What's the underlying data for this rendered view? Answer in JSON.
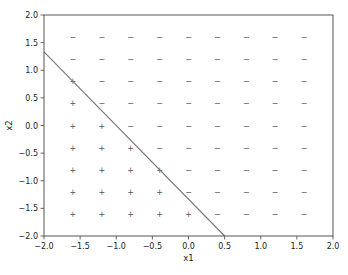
{
  "chart_data": {
    "type": "scatter",
    "title": "",
    "xlabel": "x1",
    "ylabel": "x2",
    "xlim": [
      -2.0,
      2.0
    ],
    "ylim": [
      -2.0,
      2.0
    ],
    "xticks": [
      -2.0,
      -1.5,
      -1.0,
      -0.5,
      0.0,
      0.5,
      1.0,
      1.5,
      2.0
    ],
    "yticks": [
      -2.0,
      -1.5,
      -1.0,
      -0.5,
      0.0,
      0.5,
      1.0,
      1.5,
      2.0
    ],
    "xtick_labels": [
      "−2.0",
      "−1.5",
      "−1.0",
      "−0.5",
      "0.0",
      "0.5",
      "1.0",
      "1.5",
      "2.0"
    ],
    "ytick_labels": [
      "−2.0",
      "−1.5",
      "−1.0",
      "−0.5",
      "0.0",
      "0.5",
      "1.0",
      "1.5",
      "2.0"
    ],
    "grid": false,
    "legend": null,
    "grid_x": [
      -1.6,
      -1.2,
      -0.8,
      -0.4,
      0.0,
      0.4,
      0.8,
      1.2,
      1.6
    ],
    "grid_y": [
      -1.6,
      -1.2,
      -0.8,
      -0.4,
      0.0,
      0.4,
      0.8,
      1.2,
      1.6
    ],
    "points": [
      {
        "x": -1.6,
        "y": 1.6,
        "label": "−"
      },
      {
        "x": -1.2,
        "y": 1.6,
        "label": "−"
      },
      {
        "x": -0.8,
        "y": 1.6,
        "label": "−"
      },
      {
        "x": -0.4,
        "y": 1.6,
        "label": "−"
      },
      {
        "x": 0.0,
        "y": 1.6,
        "label": "−"
      },
      {
        "x": 0.4,
        "y": 1.6,
        "label": "−"
      },
      {
        "x": 0.8,
        "y": 1.6,
        "label": "−"
      },
      {
        "x": 1.2,
        "y": 1.6,
        "label": "−"
      },
      {
        "x": 1.6,
        "y": 1.6,
        "label": "−"
      },
      {
        "x": -1.6,
        "y": 1.2,
        "label": "−"
      },
      {
        "x": -1.2,
        "y": 1.2,
        "label": "−"
      },
      {
        "x": -0.8,
        "y": 1.2,
        "label": "−"
      },
      {
        "x": -0.4,
        "y": 1.2,
        "label": "−"
      },
      {
        "x": 0.0,
        "y": 1.2,
        "label": "−"
      },
      {
        "x": 0.4,
        "y": 1.2,
        "label": "−"
      },
      {
        "x": 0.8,
        "y": 1.2,
        "label": "−"
      },
      {
        "x": 1.2,
        "y": 1.2,
        "label": "−"
      },
      {
        "x": 1.6,
        "y": 1.2,
        "label": "−"
      },
      {
        "x": -1.6,
        "y": 0.8,
        "label": "+"
      },
      {
        "x": -1.2,
        "y": 0.8,
        "label": "−"
      },
      {
        "x": -0.8,
        "y": 0.8,
        "label": "−"
      },
      {
        "x": -0.4,
        "y": 0.8,
        "label": "−"
      },
      {
        "x": 0.0,
        "y": 0.8,
        "label": "−"
      },
      {
        "x": 0.4,
        "y": 0.8,
        "label": "−"
      },
      {
        "x": 0.8,
        "y": 0.8,
        "label": "−"
      },
      {
        "x": 1.2,
        "y": 0.8,
        "label": "−"
      },
      {
        "x": 1.6,
        "y": 0.8,
        "label": "−"
      },
      {
        "x": -1.6,
        "y": 0.4,
        "label": "+"
      },
      {
        "x": -1.2,
        "y": 0.4,
        "label": "−"
      },
      {
        "x": -0.8,
        "y": 0.4,
        "label": "−"
      },
      {
        "x": -0.4,
        "y": 0.4,
        "label": "−"
      },
      {
        "x": 0.0,
        "y": 0.4,
        "label": "−"
      },
      {
        "x": 0.4,
        "y": 0.4,
        "label": "−"
      },
      {
        "x": 0.8,
        "y": 0.4,
        "label": "−"
      },
      {
        "x": 1.2,
        "y": 0.4,
        "label": "−"
      },
      {
        "x": 1.6,
        "y": 0.4,
        "label": "−"
      },
      {
        "x": -1.6,
        "y": 0.0,
        "label": "+"
      },
      {
        "x": -1.2,
        "y": 0.0,
        "label": "+"
      },
      {
        "x": -0.8,
        "y": 0.0,
        "label": "−"
      },
      {
        "x": -0.4,
        "y": 0.0,
        "label": "−"
      },
      {
        "x": 0.0,
        "y": 0.0,
        "label": "−"
      },
      {
        "x": 0.4,
        "y": 0.0,
        "label": "−"
      },
      {
        "x": 0.8,
        "y": 0.0,
        "label": "−"
      },
      {
        "x": 1.2,
        "y": 0.0,
        "label": "−"
      },
      {
        "x": 1.6,
        "y": 0.0,
        "label": "−"
      },
      {
        "x": -1.6,
        "y": -0.4,
        "label": "+"
      },
      {
        "x": -1.2,
        "y": -0.4,
        "label": "+"
      },
      {
        "x": -0.8,
        "y": -0.4,
        "label": "+"
      },
      {
        "x": -0.4,
        "y": -0.4,
        "label": "−"
      },
      {
        "x": 0.0,
        "y": -0.4,
        "label": "−"
      },
      {
        "x": 0.4,
        "y": -0.4,
        "label": "−"
      },
      {
        "x": 0.8,
        "y": -0.4,
        "label": "−"
      },
      {
        "x": 1.2,
        "y": -0.4,
        "label": "−"
      },
      {
        "x": 1.6,
        "y": -0.4,
        "label": "−"
      },
      {
        "x": -1.6,
        "y": -0.8,
        "label": "+"
      },
      {
        "x": -1.2,
        "y": -0.8,
        "label": "+"
      },
      {
        "x": -0.8,
        "y": -0.8,
        "label": "+"
      },
      {
        "x": -0.4,
        "y": -0.8,
        "label": "+"
      },
      {
        "x": 0.0,
        "y": -0.8,
        "label": "−"
      },
      {
        "x": 0.4,
        "y": -0.8,
        "label": "−"
      },
      {
        "x": 0.8,
        "y": -0.8,
        "label": "−"
      },
      {
        "x": 1.2,
        "y": -0.8,
        "label": "−"
      },
      {
        "x": 1.6,
        "y": -0.8,
        "label": "−"
      },
      {
        "x": -1.6,
        "y": -1.2,
        "label": "+"
      },
      {
        "x": -1.2,
        "y": -1.2,
        "label": "+"
      },
      {
        "x": -0.8,
        "y": -1.2,
        "label": "+"
      },
      {
        "x": -0.4,
        "y": -1.2,
        "label": "+"
      },
      {
        "x": 0.0,
        "y": -1.2,
        "label": "−"
      },
      {
        "x": 0.4,
        "y": -1.2,
        "label": "−"
      },
      {
        "x": 0.8,
        "y": -1.2,
        "label": "−"
      },
      {
        "x": 1.2,
        "y": -1.2,
        "label": "−"
      },
      {
        "x": 1.6,
        "y": -1.2,
        "label": "−"
      },
      {
        "x": -1.6,
        "y": -1.6,
        "label": "+"
      },
      {
        "x": -1.2,
        "y": -1.6,
        "label": "+"
      },
      {
        "x": -0.8,
        "y": -1.6,
        "label": "+"
      },
      {
        "x": -0.4,
        "y": -1.6,
        "label": "+"
      },
      {
        "x": 0.0,
        "y": -1.6,
        "label": "+"
      },
      {
        "x": 0.4,
        "y": -1.6,
        "label": "−"
      },
      {
        "x": 0.8,
        "y": -1.6,
        "label": "−"
      },
      {
        "x": 1.2,
        "y": -1.6,
        "label": "−"
      },
      {
        "x": 1.6,
        "y": -1.6,
        "label": "−"
      }
    ],
    "decision_boundary": {
      "type": "line",
      "equation": "x2 = -4/3 * x1 - 4/3",
      "p1": [
        -2.0,
        1.333
      ],
      "p2": [
        0.5,
        -2.0
      ],
      "color": "#777777"
    },
    "colors": {
      "axes": "#444444",
      "markers": "#555555",
      "line": "#777777",
      "background": "#ffffff"
    }
  }
}
